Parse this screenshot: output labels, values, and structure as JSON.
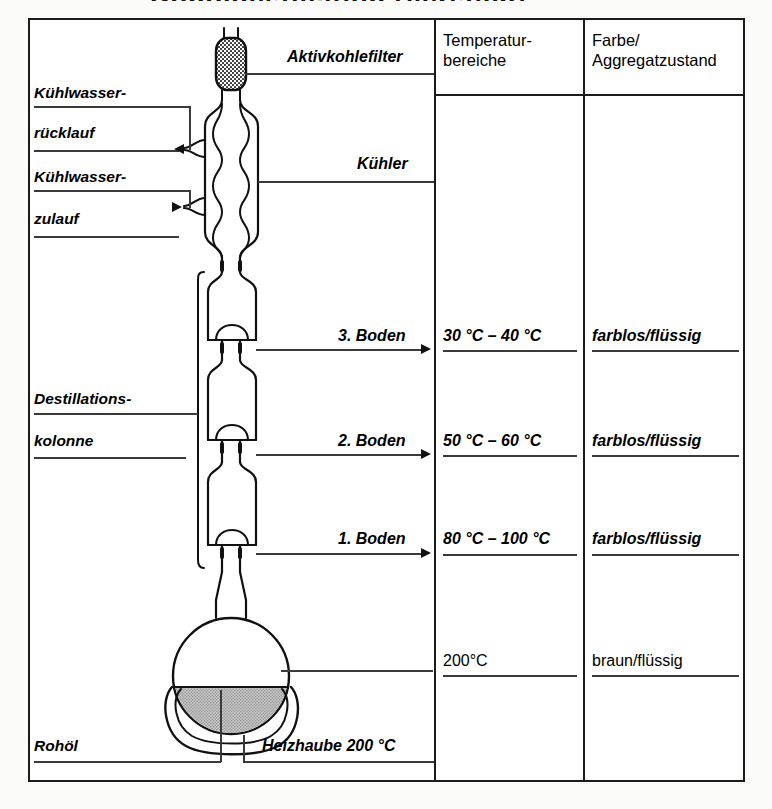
{
  "diagram": {
    "title_fragment": "Rohöldestillation (Versuch)",
    "columns": {
      "apparatus_header": "",
      "temperature_header": "Temperatur-\nbereiche",
      "state_header": "Farbe/\nAggregatzustand"
    },
    "left_labels": [
      {
        "id": "kuehlwasser-ruecklauf",
        "line1": "Kühlwasser-",
        "line2": "rücklauf"
      },
      {
        "id": "kuehlwasser-zulauf",
        "line1": "Kühlwasser-",
        "line2": "zulauf"
      },
      {
        "id": "destillationskolonne",
        "line1": "Destillations-",
        "line2": "kolonne"
      },
      {
        "id": "rohoel",
        "line1": "Rohöl",
        "line2": ""
      }
    ],
    "right_labels": [
      {
        "id": "aktivkohlefilter",
        "text": "Aktivkohlefilter"
      },
      {
        "id": "kuehler",
        "text": "Kühler"
      },
      {
        "id": "boden-3",
        "text": "3. Boden"
      },
      {
        "id": "boden-2",
        "text": "2. Boden"
      },
      {
        "id": "boden-1",
        "text": "1. Boden"
      },
      {
        "id": "heizhaube",
        "text": "Heizhaube 200 °C"
      }
    ],
    "rows": [
      {
        "id": "row-boden-3",
        "label": "3. Boden",
        "temperature": "30 °C – 40 °C",
        "state": "farblos/flüssig",
        "style": "italic"
      },
      {
        "id": "row-boden-2",
        "label": "2. Boden",
        "temperature": "50 °C – 60 °C",
        "state": "farblos/flüssig",
        "style": "italic"
      },
      {
        "id": "row-boden-1",
        "label": "1. Boden",
        "temperature": "80 °C – 100 °C",
        "state": "farblos/flüssig",
        "style": "italic"
      },
      {
        "id": "row-sumpf",
        "label": "",
        "temperature": "200°C",
        "state": "braun/flüssig",
        "style": "plain"
      }
    ],
    "colors": {
      "ink": "#1b1b1b",
      "rule": "#3a3a3a",
      "oil_fill": "#b2b2b2",
      "carbon_fill": "#2b2b2b",
      "paper": "#ffffff"
    }
  }
}
